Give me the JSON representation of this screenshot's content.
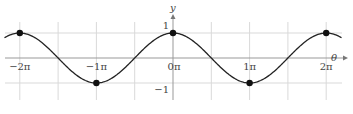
{
  "chart_data": {
    "type": "line",
    "title": "",
    "function": "y = cos(θ)",
    "xlabel": "θ",
    "ylabel": "y",
    "x_ticks": [
      {
        "value": -2,
        "label": "−2π"
      },
      {
        "value": -1,
        "label": "−1π"
      },
      {
        "value": 0,
        "label": "0π"
      },
      {
        "value": 1,
        "label": "1π"
      },
      {
        "value": 2,
        "label": "2π"
      }
    ],
    "y_ticks": [
      {
        "value": 1,
        "label": "1"
      },
      {
        "value": -1,
        "label": "−1"
      }
    ],
    "xlim_pi": [
      -2.2,
      2.2
    ],
    "ylim": [
      -1,
      1
    ],
    "grid": true,
    "grid_x_step_pi": 0.5,
    "series": [
      {
        "name": "cos θ",
        "color": "#222222",
        "x_pi": [
          -2,
          -1.5,
          -1,
          -0.5,
          0,
          0.5,
          1,
          1.5,
          2
        ],
        "y": [
          1,
          0,
          -1,
          0,
          1,
          0,
          -1,
          0,
          1
        ]
      }
    ],
    "markers": [
      {
        "x_pi": -2,
        "y": 1
      },
      {
        "x_pi": -1,
        "y": -1
      },
      {
        "x_pi": 0,
        "y": 1
      },
      {
        "x_pi": 1,
        "y": -1
      },
      {
        "x_pi": 2,
        "y": 1
      }
    ]
  }
}
